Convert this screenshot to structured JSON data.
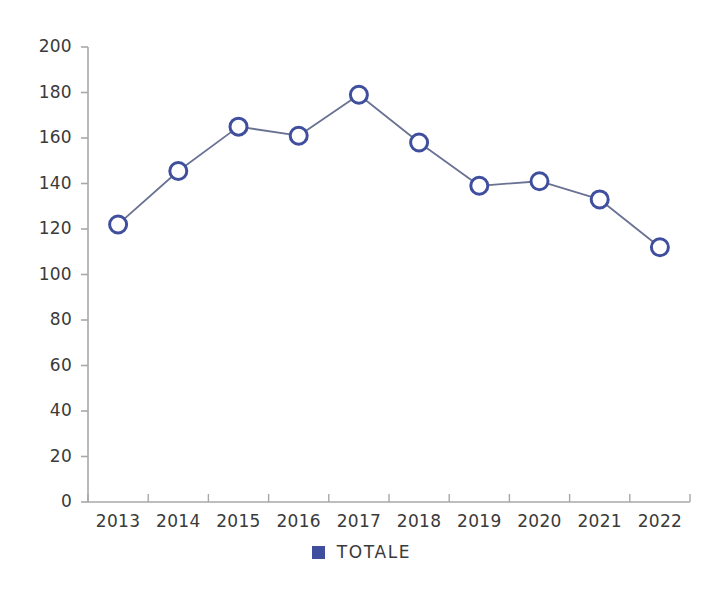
{
  "chart_data": {
    "type": "line",
    "title": "",
    "subtitle": "",
    "xlabel": "",
    "ylabel": "",
    "categories": [
      "2013",
      "2014",
      "2015",
      "2016",
      "2017",
      "2018",
      "2019",
      "2020",
      "2021",
      "2022"
    ],
    "series": [
      {
        "name": "TOTALE",
        "values": [
          122,
          145.5,
          165,
          161,
          179,
          158,
          139,
          141,
          133,
          112
        ],
        "color": "#3f4f9e",
        "line_color": "#6a7294",
        "marker": "open-circle",
        "marker_fill": "#ffffff"
      }
    ],
    "ylim": [
      0,
      200
    ],
    "yticks": [
      0,
      20,
      40,
      60,
      80,
      100,
      120,
      140,
      160,
      180,
      200
    ],
    "ytick_labels": [
      "0",
      "20",
      "40",
      "60",
      "80",
      "100",
      "120",
      "140",
      "160",
      "180",
      "200"
    ],
    "grid": false,
    "legend": {
      "position": "bottom",
      "entries": [
        {
          "label": "TOTALE",
          "color": "#3f4f9e"
        }
      ]
    },
    "axis_color": "#a8a8a8",
    "background": "#ffffff"
  }
}
